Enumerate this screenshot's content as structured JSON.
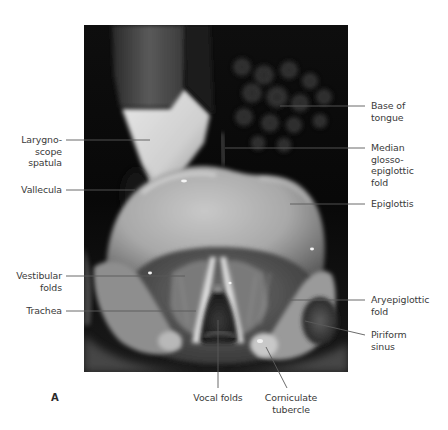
{
  "figure": {
    "panel_letter": "A",
    "photo": {
      "x": 84,
      "y": 25,
      "width": 264,
      "height": 347
    },
    "line_color": "#5a5a5a",
    "text_color": "#3a3a3a",
    "labels": [
      {
        "id": "laryngoscope-spatula",
        "text": "Larygno-\nscope\nspatula",
        "align": "right",
        "x": 6,
        "y": 134,
        "w": 56
      },
      {
        "id": "vallecula",
        "text": "Vallecula",
        "align": "right",
        "x": 6,
        "y": 184,
        "w": 56
      },
      {
        "id": "vestibular-folds",
        "text": "Vestibular\nfolds",
        "align": "right",
        "x": 6,
        "y": 270,
        "w": 56
      },
      {
        "id": "trachea",
        "text": "Trachea",
        "align": "right",
        "x": 6,
        "y": 305,
        "w": 56
      },
      {
        "id": "base-of-tongue",
        "text": "Base of\ntongue",
        "align": "left",
        "x": 371,
        "y": 100,
        "w": 75
      },
      {
        "id": "median-glosso-epiglottic-fold",
        "text": "Median\nglosso-\nepiglottic\nfold",
        "align": "left",
        "x": 371,
        "y": 142,
        "w": 75
      },
      {
        "id": "epiglottis",
        "text": "Epiglottis",
        "align": "left",
        "x": 371,
        "y": 198,
        "w": 75
      },
      {
        "id": "aryepiglottic-fold",
        "text": "Aryepiglottic\nfold",
        "align": "left",
        "x": 371,
        "y": 294,
        "w": 75
      },
      {
        "id": "piriform-sinus",
        "text": "Piriform\nsinus",
        "align": "left",
        "x": 371,
        "y": 329,
        "w": 75
      },
      {
        "id": "vocal-folds",
        "text": "Vocal folds",
        "align": "center",
        "x": 183,
        "y": 392,
        "w": 70
      },
      {
        "id": "corniculate-tubercle",
        "text": "Corniculate\ntubercle",
        "align": "center",
        "x": 256,
        "y": 392,
        "w": 70
      }
    ],
    "leaders": [
      {
        "id": "laryngoscope-spatula",
        "x1": 66,
        "y1": 140,
        "x2": 150,
        "y2": 140
      },
      {
        "id": "vallecula",
        "x1": 66,
        "y1": 190,
        "x2": 135,
        "y2": 190
      },
      {
        "id": "vestibular-folds",
        "x1": 66,
        "y1": 276,
        "x2": 185,
        "y2": 276
      },
      {
        "id": "trachea",
        "x1": 66,
        "y1": 311,
        "x2": 196,
        "y2": 311
      },
      {
        "id": "base-of-tongue",
        "x1": 280,
        "y1": 106,
        "x2": 365,
        "y2": 106
      },
      {
        "id": "median-glosso-epiglottic-fold",
        "x1": 225,
        "y1": 148,
        "x2": 365,
        "y2": 148
      },
      {
        "id": "epiglottis",
        "x1": 290,
        "y1": 204,
        "x2": 365,
        "y2": 204
      },
      {
        "id": "aryepiglottic-fold",
        "x1": 287,
        "y1": 300,
        "x2": 365,
        "y2": 300
      },
      {
        "id": "piriform-sinus",
        "x1": 305,
        "y1": 321,
        "x2": 365,
        "y2": 335
      },
      {
        "id": "vocal-folds",
        "x1": 218,
        "y1": 320,
        "x2": 218,
        "y2": 388
      },
      {
        "id": "corniculate-tubercle",
        "x1": 266,
        "y1": 347,
        "x2": 287,
        "y2": 388
      }
    ]
  }
}
